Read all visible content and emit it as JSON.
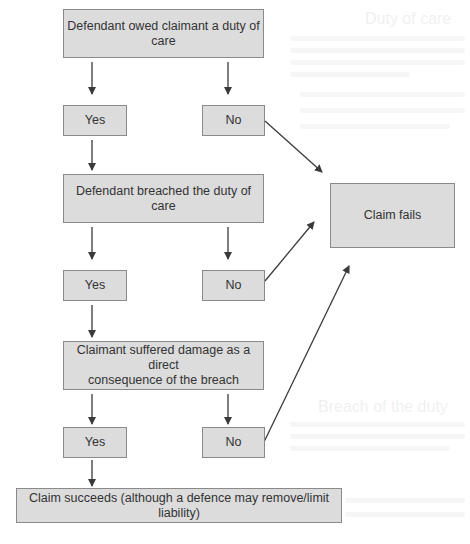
{
  "diagram": {
    "type": "flowchart",
    "colors": {
      "box_fill": "#dcdcdc",
      "box_border": "#8a8a8a",
      "text": "#333333",
      "arrow": "#3a3a3a"
    },
    "nodes": {
      "duty": {
        "label": "Defendant owed claimant a duty of care"
      },
      "duty_yes": {
        "label": "Yes"
      },
      "duty_no": {
        "label": "No"
      },
      "breach": {
        "label": "Defendant breached the duty of care"
      },
      "breach_yes": {
        "label": "Yes"
      },
      "breach_no": {
        "label": "No"
      },
      "damage": {
        "label_line1": "Claimant suffered damage as a direct",
        "label_line2": "consequence of the breach"
      },
      "damage_yes": {
        "label": "Yes"
      },
      "damage_no": {
        "label": "No"
      },
      "fails": {
        "label": "Claim fails"
      },
      "succeeds": {
        "label": "Claim succeeds (although a defence may remove/limit liability)"
      }
    },
    "edges": [
      {
        "from": "duty",
        "to": "duty_yes"
      },
      {
        "from": "duty",
        "to": "duty_no"
      },
      {
        "from": "duty_yes",
        "to": "breach"
      },
      {
        "from": "duty_no",
        "to": "fails"
      },
      {
        "from": "breach",
        "to": "breach_yes"
      },
      {
        "from": "breach",
        "to": "breach_no"
      },
      {
        "from": "breach_yes",
        "to": "damage"
      },
      {
        "from": "breach_no",
        "to": "fails"
      },
      {
        "from": "damage",
        "to": "damage_yes"
      },
      {
        "from": "damage",
        "to": "damage_no"
      },
      {
        "from": "damage_yes",
        "to": "succeeds"
      },
      {
        "from": "damage_no",
        "to": "fails"
      }
    ]
  },
  "background_bleed": {
    "heading1": "Duty of care",
    "heading2": "Breach of the duty"
  }
}
